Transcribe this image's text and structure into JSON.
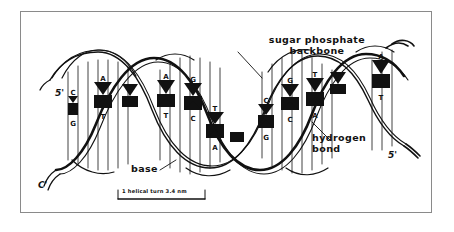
{
  "figure": {
    "style": "hand-drawn line art, black on white",
    "border_color": "#8a8a8a",
    "background": "#ffffff",
    "ink_color": "#111111"
  },
  "annotations": {
    "backbone": {
      "line1": "sugar phosphate",
      "line2": "backbone"
    },
    "base": "base",
    "hydrogen_bond": {
      "line1": "hydrogen",
      "line2": "bond"
    },
    "end_left_top": "5'",
    "end_left_bottom": "C'",
    "end_right_bottom": "5'"
  },
  "scale_bar": {
    "label_left": "1 helical turn",
    "label_right": "3.4 nm",
    "full_text": "1 helical turn   3.4 nm"
  },
  "base_pairs": [
    {
      "top": "C",
      "bottom": "G"
    },
    {
      "top": "A",
      "bottom": "T"
    },
    {
      "top": "A",
      "bottom": "T"
    },
    {
      "top": "G",
      "bottom": "C"
    },
    {
      "top": "T",
      "bottom": "A"
    },
    {
      "top": "C",
      "bottom": "G"
    },
    {
      "top": "G",
      "bottom": "C"
    },
    {
      "top": "T",
      "bottom": "A"
    },
    {
      "top": "A",
      "bottom": "T"
    }
  ],
  "legend_keys": {
    "helix_turns": 3,
    "strands": 2
  }
}
